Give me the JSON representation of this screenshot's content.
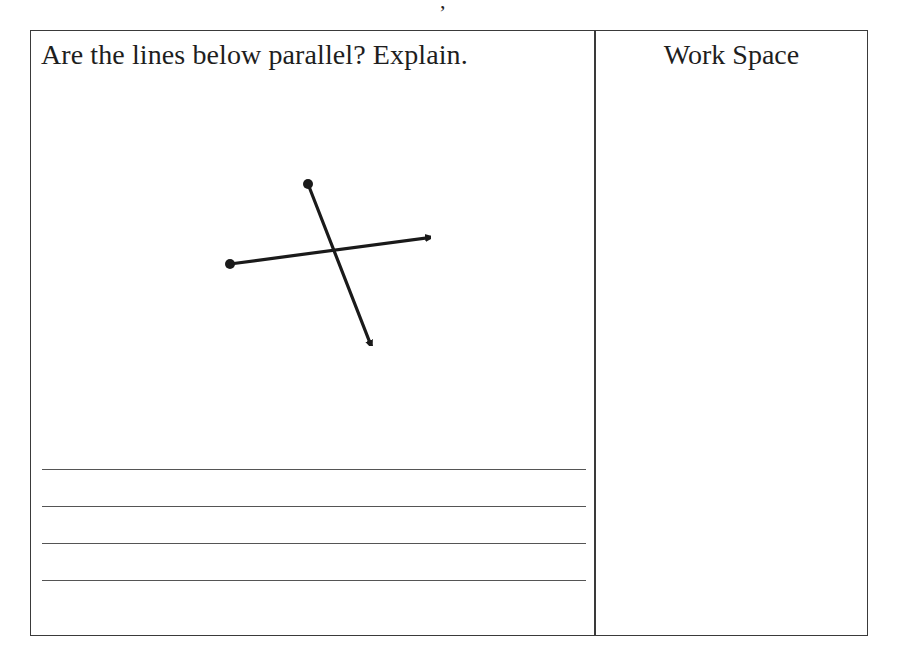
{
  "page": {
    "top_fragment": ","
  },
  "question_column": {
    "prompt": "Are the lines below parallel? Explain.",
    "diagram": {
      "description": "Two intersecting rays crossing at one point",
      "ray_1": {
        "start_point": "dot",
        "end": "arrow",
        "direction": "left-to-right, slightly rising"
      },
      "ray_2": {
        "start_point": "dot",
        "end": "arrow",
        "direction": "top-to-bottom, slightly slanted right"
      }
    },
    "answer_lines": [
      {
        "value": ""
      },
      {
        "value": ""
      },
      {
        "value": ""
      },
      {
        "value": ""
      }
    ]
  },
  "workspace_column": {
    "title": "Work Space"
  },
  "colors": {
    "border": "#3a3a3a",
    "ink": "#1e1e1e",
    "answer_line": "#555555"
  }
}
